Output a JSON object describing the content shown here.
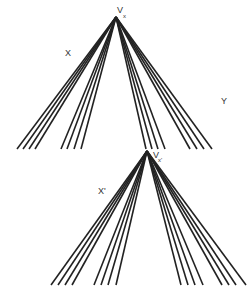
{
  "diagram": {
    "stroke_color": "#222222",
    "background": "#ffffff",
    "fans": [
      {
        "name": "top-fan",
        "apex": [
          116,
          17
        ],
        "base_y": 149,
        "endpoints_x": [
          17,
          23,
          29,
          35,
          61,
          67,
          74,
          81,
          146,
          152,
          158,
          165,
          190,
          197,
          204,
          212
        ],
        "apex_label": "V",
        "apex_subscript": "x"
      },
      {
        "name": "bottom-fan",
        "apex": [
          147,
          151
        ],
        "base_y": 285,
        "endpoints_x": [
          51,
          58,
          65,
          72,
          94,
          101,
          108,
          116,
          181,
          188,
          195,
          203,
          222,
          229,
          236,
          246
        ],
        "apex_label": "V",
        "apex_subscript": "x'"
      }
    ],
    "labels": {
      "x": "X",
      "y": "Y",
      "x_prime": "X'"
    }
  }
}
